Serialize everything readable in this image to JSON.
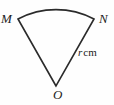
{
  "figure": {
    "name": "circular-sector-diagram",
    "background_color": "#fefefe",
    "stroke_color": "#2b2b2b",
    "stroke_width": 1.6,
    "width": 114,
    "height": 105
  },
  "labels": {
    "vertex_left": "M",
    "vertex_right": "N",
    "vertex_centre": "O",
    "radius_symbol": "r",
    "radius_unit": "cm"
  },
  "geometry": {
    "centre": {
      "x": 56,
      "y": 86
    },
    "arc_left_end": {
      "x": 18,
      "y": 19
    },
    "arc_right_end": {
      "x": 94,
      "y": 19
    },
    "arc_apex": {
      "x": 56,
      "y": 8
    },
    "arc_radius": 82,
    "path": "M 56 86 L 18 19 A 82 82 0 0 1 94 19 Z"
  }
}
